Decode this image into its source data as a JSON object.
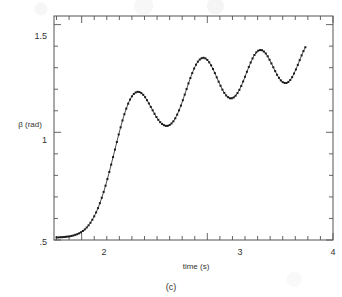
{
  "figure": {
    "caption": "(c)",
    "axis": {
      "xlabel": "time (s)",
      "ylabel": "β (rad)",
      "x_ticklabels": [
        "2",
        "3",
        "4"
      ],
      "y_ticklabels": [
        "1.5",
        "1",
        ".5"
      ]
    },
    "colors": {
      "frame": "#555555",
      "curve": "#3a3a3a",
      "marker": "#1a1a1a",
      "background": "#ffffff"
    }
  },
  "chart_data": {
    "type": "line",
    "title": "",
    "subtitle": "",
    "xlabel": "time (s)",
    "ylabel": "β (rad)",
    "xlim": [
      1.78,
      4.0
    ],
    "ylim": [
      0.5,
      1.54
    ],
    "xticks": [
      2,
      3,
      4
    ],
    "yticks": [
      0.5,
      1.0,
      1.5
    ],
    "xticklabels": [
      "2",
      "3",
      "4"
    ],
    "yticklabels": [
      ".5",
      "1",
      "1.5"
    ],
    "x_minor_tick_interval": 0.1,
    "y_minor_tick_interval": 0.1,
    "grid": false,
    "legend": null,
    "legend_position": "none",
    "annotations": [
      "(c)"
    ],
    "marker": "square",
    "marker_size_px": 2,
    "series": [
      {
        "name": "beta",
        "x": [
          1.8,
          1.815,
          1.83,
          1.845,
          1.86,
          1.875,
          1.89,
          1.905,
          1.92,
          1.935,
          1.95,
          1.965,
          1.98,
          1.995,
          2.01,
          2.025,
          2.04,
          2.055,
          2.07,
          2.085,
          2.1,
          2.115,
          2.13,
          2.145,
          2.16,
          2.175,
          2.19,
          2.205,
          2.22,
          2.235,
          2.25,
          2.265,
          2.28,
          2.295,
          2.31,
          2.325,
          2.34,
          2.355,
          2.37,
          2.385,
          2.4,
          2.415,
          2.43,
          2.445,
          2.46,
          2.475,
          2.49,
          2.505,
          2.52,
          2.535,
          2.55,
          2.565,
          2.58,
          2.595,
          2.61,
          2.625,
          2.64,
          2.655,
          2.67,
          2.685,
          2.7,
          2.715,
          2.73,
          2.745,
          2.76,
          2.775,
          2.79,
          2.805,
          2.82,
          2.835,
          2.85,
          2.865,
          2.88,
          2.895,
          2.91,
          2.925,
          2.94,
          2.955,
          2.97,
          2.985,
          3.0,
          3.015,
          3.03,
          3.045,
          3.06,
          3.075,
          3.09,
          3.105,
          3.12,
          3.135,
          3.15,
          3.165,
          3.18,
          3.195,
          3.21,
          3.225,
          3.24,
          3.255,
          3.27,
          3.285,
          3.3,
          3.315,
          3.33,
          3.345,
          3.36,
          3.375,
          3.39,
          3.405,
          3.42,
          3.435,
          3.45,
          3.465,
          3.48,
          3.495,
          3.51,
          3.525,
          3.54,
          3.555,
          3.57,
          3.585,
          3.6,
          3.615,
          3.63,
          3.645,
          3.66,
          3.675,
          3.69,
          3.705,
          3.72,
          3.735,
          3.75,
          3.765,
          3.78
        ],
        "y": [
          0.512,
          0.512,
          0.513,
          0.513,
          0.514,
          0.515,
          0.516,
          0.517,
          0.519,
          0.521,
          0.524,
          0.527,
          0.531,
          0.536,
          0.542,
          0.549,
          0.558,
          0.568,
          0.58,
          0.594,
          0.61,
          0.628,
          0.648,
          0.671,
          0.696,
          0.723,
          0.752,
          0.783,
          0.816,
          0.85,
          0.885,
          0.92,
          0.955,
          0.99,
          1.023,
          1.055,
          1.084,
          1.11,
          1.133,
          1.152,
          1.167,
          1.178,
          1.185,
          1.188,
          1.187,
          1.182,
          1.174,
          1.163,
          1.149,
          1.134,
          1.118,
          1.102,
          1.086,
          1.071,
          1.058,
          1.047,
          1.039,
          1.033,
          1.03,
          1.03,
          1.034,
          1.041,
          1.051,
          1.065,
          1.082,
          1.102,
          1.124,
          1.149,
          1.175,
          1.201,
          1.227,
          1.252,
          1.275,
          1.296,
          1.314,
          1.328,
          1.338,
          1.344,
          1.346,
          1.343,
          1.336,
          1.325,
          1.311,
          1.294,
          1.275,
          1.255,
          1.235,
          1.216,
          1.198,
          1.183,
          1.171,
          1.163,
          1.158,
          1.158,
          1.162,
          1.17,
          1.182,
          1.197,
          1.215,
          1.236,
          1.258,
          1.281,
          1.303,
          1.324,
          1.343,
          1.359,
          1.371,
          1.379,
          1.382,
          1.381,
          1.375,
          1.366,
          1.353,
          1.337,
          1.32,
          1.302,
          1.284,
          1.267,
          1.253,
          1.241,
          1.233,
          1.229,
          1.229,
          1.234,
          1.243,
          1.256,
          1.273,
          1.292,
          1.313,
          1.335,
          1.357,
          1.377,
          1.395
        ]
      }
    ],
    "peaks": [
      {
        "t": 2.44,
        "beta": 1.188
      },
      {
        "t": 2.97,
        "beta": 1.346
      },
      {
        "t": 3.42,
        "beta": 1.382
      },
      {
        "t": 3.78,
        "beta": 1.395
      }
    ],
    "troughs": [
      {
        "t": 2.685,
        "beta": 1.03
      },
      {
        "t": 3.18,
        "beta": 1.158
      },
      {
        "t": 3.63,
        "beta": 1.229
      }
    ]
  }
}
